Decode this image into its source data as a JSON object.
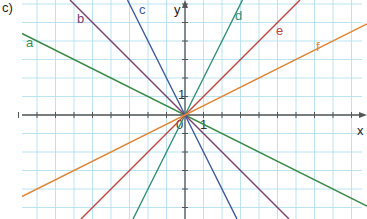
{
  "part_label": "c)",
  "axes": {
    "x_label": "x",
    "y_label": "y",
    "origin_label": "0",
    "x_unit_label": "1",
    "y_unit_label": "1"
  },
  "colors": {
    "grid": "#a9dcef",
    "axis": "#555555",
    "a": "#3e8a4a",
    "b": "#7a3f6e",
    "c": "#3b57a0",
    "d": "#2f8f76",
    "e": "#c0463f",
    "f": "#e08a3c"
  },
  "chart_data": {
    "type": "line",
    "title": "",
    "xlabel": "x",
    "ylabel": "y",
    "xlim": [
      -9,
      10
    ],
    "ylim": [
      -6,
      6
    ],
    "grid": true,
    "series": [
      {
        "name": "a",
        "slope": -0.5,
        "intercept": 0,
        "points": [
          [
            -9,
            4.5
          ],
          [
            10,
            -5
          ]
        ]
      },
      {
        "name": "b",
        "slope": -1,
        "intercept": 0,
        "points": [
          [
            -6,
            6
          ],
          [
            6,
            -6
          ]
        ]
      },
      {
        "name": "c",
        "slope": -2,
        "intercept": 0,
        "points": [
          [
            -3,
            6
          ],
          [
            3,
            -6
          ]
        ]
      },
      {
        "name": "d",
        "slope": 2,
        "intercept": 0,
        "points": [
          [
            -3,
            -6
          ],
          [
            3,
            6
          ]
        ]
      },
      {
        "name": "e",
        "slope": 1,
        "intercept": 0,
        "points": [
          [
            -6,
            -6
          ],
          [
            6,
            6
          ]
        ]
      },
      {
        "name": "f",
        "slope": 0.5,
        "intercept": 0,
        "points": [
          [
            -9,
            -4.5
          ],
          [
            10,
            5
          ]
        ]
      }
    ]
  }
}
